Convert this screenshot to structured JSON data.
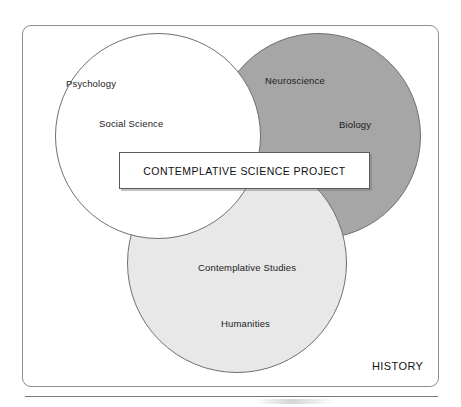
{
  "figure": {
    "banner_label": "CONTEMPLATIVE SCIENCE PROJECT",
    "outer_label": "HISTORY"
  },
  "colors": {
    "frame_border": "#8d8d8d",
    "circle_outline": "#6f6f6f",
    "circle_science_fill": "#a6a6a6",
    "circle_humanities_fill": "#e8e8e8",
    "circle_psychology_fill": "#ffffff",
    "banner_fill": "#ffffff",
    "banner_border": "#5a5a5a",
    "text": "#1c1c1c",
    "rule": "#7a7a7a"
  },
  "chart_data": {
    "type": "diagram",
    "diagram_type": "venn",
    "set_count": 3,
    "center_overlap_label": "CONTEMPLATIVE SCIENCE PROJECT",
    "background_set_label": "HISTORY",
    "sets": [
      {
        "id": "psychology",
        "position": "left",
        "fill": "#ffffff",
        "labels": [
          "Psychology",
          "Social Science"
        ]
      },
      {
        "id": "biology",
        "position": "right",
        "fill": "#a6a6a6",
        "labels": [
          "Neuroscience",
          "Biology"
        ]
      },
      {
        "id": "humanities",
        "position": "bottom",
        "fill": "#e8e8e8",
        "labels": [
          "Contemplative Studies",
          "Humanities"
        ]
      }
    ]
  },
  "labels": {
    "psychology": "Psychology",
    "social_science": "Social Science",
    "neuroscience": "Neuroscience",
    "biology": "Biology",
    "contemplative_studies": "Contemplative Studies",
    "humanities": "Humanities"
  }
}
